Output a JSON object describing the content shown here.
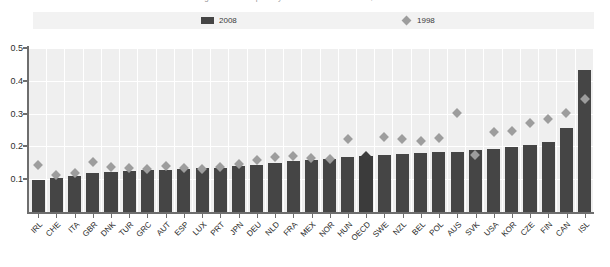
{
  "title_sliver": "Figure: Relative poverty rates in OECD countries, mid-2000s",
  "legend": {
    "entries": [
      {
        "label": "2008",
        "marker": "bar-swatch",
        "color": "#454545"
      },
      {
        "label": "1998",
        "marker": "diamond-swatch",
        "color": "#9d9d9d"
      }
    ]
  },
  "colors": {
    "bar_2008": "#454545",
    "bar_2008_highlight": "#3b3b3b",
    "diamond_1998": "#9d9d9d",
    "diamond_1998_highlight": "#3d3d3d",
    "plot_background": "#efefef",
    "gridline": "#ffffff",
    "axis": "#6e6e6e"
  },
  "chart_data": {
    "type": "bar",
    "title": "",
    "xlabel": "",
    "ylabel": "",
    "ylim": [
      0,
      0.5
    ],
    "yticks": [
      0.1,
      0.2,
      0.3,
      0.4,
      0.5
    ],
    "ytick_labels": [
      "0.1",
      "0.2",
      "0.3",
      "0.4",
      "0.5"
    ],
    "grid": true,
    "legend_position": "top",
    "highlight_category": "OECD",
    "categories": [
      "IRL",
      "CHE",
      "ITA",
      "GBR",
      "DNK",
      "TUR",
      "GRC",
      "AUT",
      "ESP",
      "LUX",
      "PRT",
      "JPN",
      "DEU",
      "NLD",
      "FRA",
      "MEX",
      "NOR",
      "HUN",
      "OECD",
      "SWE",
      "NZL",
      "BEL",
      "POL",
      "AUS",
      "SVK",
      "USA",
      "KOR",
      "CZE",
      "FIN",
      "CAN",
      "ISL"
    ],
    "series": [
      {
        "name": "2008",
        "type": "bar",
        "values": [
          0.097,
          0.105,
          0.111,
          0.118,
          0.121,
          0.124,
          0.127,
          0.129,
          0.131,
          0.133,
          0.135,
          0.139,
          0.143,
          0.148,
          0.155,
          0.159,
          0.163,
          0.167,
          0.171,
          0.175,
          0.178,
          0.18,
          0.182,
          0.184,
          0.188,
          0.193,
          0.198,
          0.203,
          0.213,
          0.255,
          0.434
        ]
      },
      {
        "name": "1998",
        "type": "scatter",
        "values": [
          0.143,
          0.112,
          0.118,
          0.152,
          0.138,
          0.135,
          0.132,
          0.14,
          0.135,
          0.13,
          0.136,
          0.147,
          0.158,
          0.169,
          0.172,
          0.166,
          0.161,
          0.222,
          0.172,
          0.229,
          0.222,
          0.217,
          0.227,
          0.303,
          0.175,
          0.244,
          0.248,
          0.27,
          0.283,
          0.303,
          0.345
        ]
      }
    ]
  }
}
